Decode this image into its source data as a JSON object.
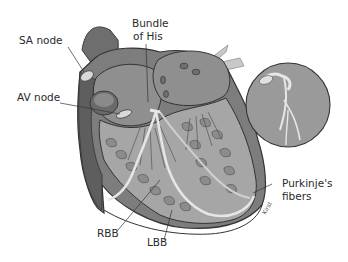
{
  "diagram": {
    "labels": {
      "sa_node": "SA node",
      "bundle_of_his_line1": "Bundle",
      "bundle_of_his_line2": "of His",
      "av_node": "AV node",
      "rbb": "RBB",
      "lbb": "LBB",
      "purkinje_line1": "Purkinje's",
      "purkinje_line2": "fibers"
    },
    "artist_signature": "Kirst",
    "colors": {
      "outline": "#3a3a3a",
      "dark_tissue": "#6e6e6e",
      "mid_tissue": "#8f8f8f",
      "light_tissue": "#b5b5b5",
      "pale": "#d6d6d6",
      "text": "#2a2a2a",
      "background": "#ffffff"
    }
  }
}
